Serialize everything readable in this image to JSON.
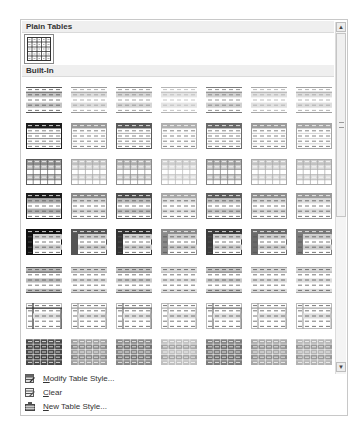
{
  "gallery": {
    "sections": [
      {
        "label": "Plain Tables"
      },
      {
        "label": "Built-In"
      }
    ],
    "plain_tables": [
      {
        "name": "table-grid",
        "style": "grid",
        "selected": true
      }
    ],
    "builtin_rows": [
      {
        "style": "light-shading",
        "variants": [
          "#555555",
          "#9a9a9a",
          "#8a8a8a",
          "#b5b5b5",
          "#7a7a7a",
          "#a8a8a8",
          "#a0a0a0"
        ]
      },
      {
        "style": "light-list",
        "variants": [
          "#1e1e1e",
          "#9a9a9a",
          "#5a5a5a",
          "#b0b0b0",
          "#6a6a6a",
          "#9c9c9c",
          "#a6a6a6"
        ]
      },
      {
        "style": "light-grid",
        "variants": [
          "#5a5a5a",
          "#a5a5a5",
          "#8a8a8a",
          "#b8b8b8",
          "#7c7c7c",
          "#a9a9a9",
          "#a8a8a8"
        ]
      },
      {
        "style": "medium-shading-1",
        "variants": [
          "#1e1e1e",
          "#8a8a8a",
          "#4e4e4e",
          "#a8a8a8",
          "#5e5e5e",
          "#8f8f8f",
          "#9a9a9a"
        ]
      },
      {
        "style": "medium-shading-2",
        "variants": [
          "#111111",
          "#555555",
          "#333333",
          "#8a8a8a",
          "#3c3c3c",
          "#6a6a6a",
          "#7a7a7a"
        ]
      },
      {
        "style": "medium-list-1",
        "variants": [
          "#555555",
          "#9a9a9a",
          "#7a7a7a",
          "#b0b0b0",
          "#777777",
          "#a5a5a5",
          "#a8a8a8"
        ]
      },
      {
        "style": "medium-list-2",
        "variants": [
          "#2a2a2a",
          "#9a9a9a",
          "#6a6a6a",
          "#b0b0b0",
          "#6e6e6e",
          "#9e9e9e",
          "#a6a6a6"
        ]
      },
      {
        "style": "medium-grid",
        "variants": [
          "#4a4a4a",
          "#a0a0a0",
          "#888888",
          "#c0c0c0",
          "#7e7e7e",
          "#a8a8a8",
          "#b4b4b4"
        ]
      }
    ]
  },
  "scrollbar": {
    "up_arrow": "▲",
    "down_arrow": "▼"
  },
  "menu": {
    "items": [
      {
        "label_access": "M",
        "label_rest": "odify Table Style...",
        "icon": "modify-table-style-icon"
      },
      {
        "label_access": "C",
        "label_rest": "lear",
        "icon": "clear-table-style-icon"
      },
      {
        "label_access": "N",
        "label_rest": "ew Table Style...",
        "icon": "new-table-style-icon"
      }
    ]
  }
}
